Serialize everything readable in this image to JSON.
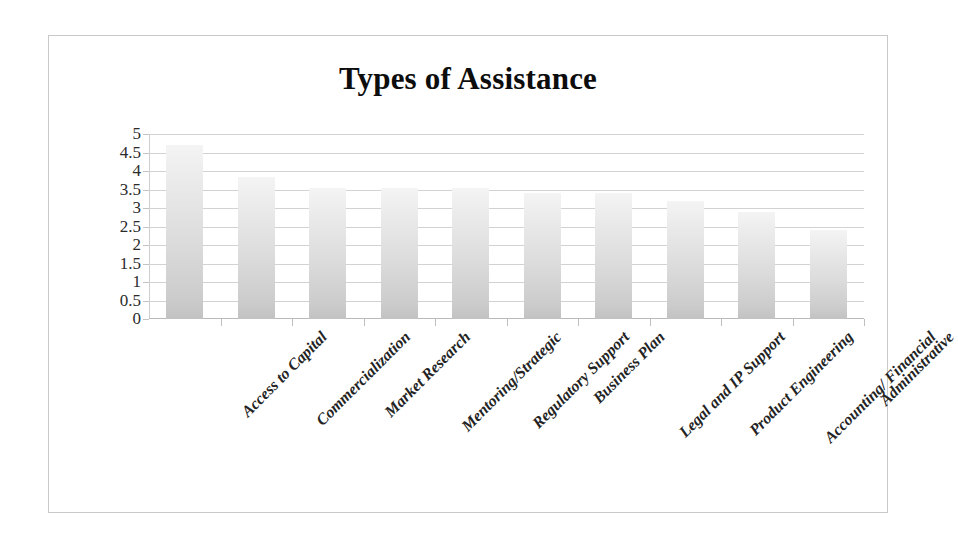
{
  "chart_data": {
    "type": "bar",
    "title": "Types of Assistance",
    "xlabel": "",
    "ylabel": "",
    "ylim": [
      0,
      5
    ],
    "ytick_step": 0.5,
    "grid": true,
    "legend": false,
    "categories": [
      "Access to Capital",
      "Commercialization",
      "Market Research",
      "Mentoring/Strategic",
      "Regulatory Support",
      "Business Plan",
      "Legal and IP Support",
      "Product Engineering",
      "Accounting/ Financial",
      "Administrative"
    ],
    "values": [
      4.7,
      3.85,
      3.55,
      3.55,
      3.55,
      3.4,
      3.4,
      3.2,
      2.9,
      2.4
    ],
    "ytick_labels": [
      "5",
      "4.5",
      "4",
      "3.5",
      "3",
      "2.5",
      "2",
      "1.5",
      "1",
      "0.5",
      "0"
    ],
    "ytick_values": [
      5,
      4.5,
      4,
      3.5,
      3,
      2.5,
      2,
      1.5,
      1,
      0.5,
      0
    ],
    "bar_color_top": "#f4f4f4",
    "bar_color_bottom": "#c2c2c2",
    "gridline_color": "#d2d2d2",
    "axis_color": "#b9b9b9",
    "title_color": "#0d0d0d",
    "background": "#ffffff",
    "border_color": "#c9c9c9"
  }
}
